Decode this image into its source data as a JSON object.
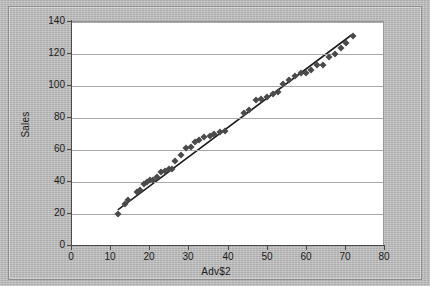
{
  "chart_data": {
    "type": "scatter",
    "title": "",
    "xlabel": "Adv$2",
    "ylabel": "Sales",
    "xlim": [
      0,
      80
    ],
    "ylim": [
      0,
      140
    ],
    "xticks": [
      0,
      10,
      20,
      30,
      40,
      50,
      60,
      70,
      80
    ],
    "yticks": [
      0,
      20,
      40,
      60,
      80,
      100,
      120,
      140
    ],
    "grid": "horizontal",
    "legend": "none",
    "marker_color": "#4a4a4a",
    "marker_shape": "diamond",
    "trendline": {
      "present": true,
      "color": "#1f1f1f",
      "x_start": 12,
      "y_start": 22,
      "x_end": 72,
      "y_end": 132
    },
    "points": [
      {
        "x": 12.0,
        "y": 20
      },
      {
        "x": 13.8,
        "y": 26
      },
      {
        "x": 14.5,
        "y": 29
      },
      {
        "x": 16.8,
        "y": 34
      },
      {
        "x": 17.6,
        "y": 35
      },
      {
        "x": 18.6,
        "y": 39
      },
      {
        "x": 19.4,
        "y": 40
      },
      {
        "x": 20.2,
        "y": 41
      },
      {
        "x": 21.0,
        "y": 41
      },
      {
        "x": 22.0,
        "y": 43
      },
      {
        "x": 23.0,
        "y": 46
      },
      {
        "x": 24.0,
        "y": 47
      },
      {
        "x": 25.0,
        "y": 48
      },
      {
        "x": 25.8,
        "y": 48
      },
      {
        "x": 26.6,
        "y": 53
      },
      {
        "x": 28.0,
        "y": 57
      },
      {
        "x": 29.4,
        "y": 61
      },
      {
        "x": 30.6,
        "y": 62
      },
      {
        "x": 31.6,
        "y": 65
      },
      {
        "x": 32.8,
        "y": 66
      },
      {
        "x": 34.0,
        "y": 68
      },
      {
        "x": 35.4,
        "y": 69
      },
      {
        "x": 36.6,
        "y": 70
      },
      {
        "x": 38.0,
        "y": 71
      },
      {
        "x": 39.4,
        "y": 72
      },
      {
        "x": 44.2,
        "y": 83
      },
      {
        "x": 45.6,
        "y": 85
      },
      {
        "x": 47.4,
        "y": 91
      },
      {
        "x": 48.6,
        "y": 92
      },
      {
        "x": 50.0,
        "y": 93
      },
      {
        "x": 51.6,
        "y": 95
      },
      {
        "x": 53.0,
        "y": 96
      },
      {
        "x": 54.2,
        "y": 101
      },
      {
        "x": 55.6,
        "y": 104
      },
      {
        "x": 57.2,
        "y": 106
      },
      {
        "x": 58.8,
        "y": 108
      },
      {
        "x": 60.0,
        "y": 108
      },
      {
        "x": 61.4,
        "y": 110
      },
      {
        "x": 63.0,
        "y": 113
      },
      {
        "x": 64.4,
        "y": 113
      },
      {
        "x": 66.0,
        "y": 118
      },
      {
        "x": 67.4,
        "y": 120
      },
      {
        "x": 69.0,
        "y": 124
      },
      {
        "x": 70.4,
        "y": 127
      },
      {
        "x": 72.0,
        "y": 131
      }
    ]
  },
  "axis": {
    "y_label": "Sales",
    "x_label": "Adv$2",
    "y_tick_labels": [
      "0",
      "20",
      "40",
      "60",
      "80",
      "100",
      "120",
      "140"
    ],
    "x_tick_labels": [
      "0",
      "10",
      "20",
      "30",
      "40",
      "50",
      "60",
      "70",
      "80"
    ]
  }
}
